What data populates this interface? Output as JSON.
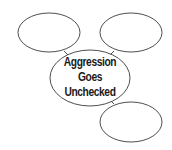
{
  "diagram": {
    "type": "concept-web",
    "center": {
      "lines": [
        "Aggression",
        "Goes",
        "Unchecked"
      ]
    },
    "nodes": [
      {
        "position": "top-left",
        "text": ""
      },
      {
        "position": "top-right",
        "text": ""
      },
      {
        "position": "bottom-right",
        "text": ""
      }
    ],
    "colors": {
      "stroke": "#3a3a3a",
      "fill": "#ffffff",
      "text": "#1a1a1a"
    }
  }
}
